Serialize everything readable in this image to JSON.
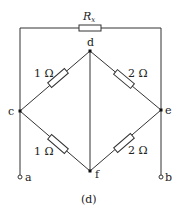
{
  "diagram": {
    "type": "circuit",
    "caption": "(d)",
    "nodes": {
      "c": "c",
      "d": "d",
      "e": "e",
      "f": "f",
      "a": "a",
      "b": "b"
    },
    "resistors": {
      "rx": "R",
      "rx_sub": "x",
      "cd": "1 Ω",
      "de": "2 Ω",
      "cf": "1 Ω",
      "fe": "2 Ω"
    },
    "connections": [
      {
        "from": "c",
        "to": "e",
        "via": "Rx (top wire)"
      },
      {
        "from": "c",
        "to": "d",
        "via": "1 Ω"
      },
      {
        "from": "d",
        "to": "e",
        "via": "2 Ω"
      },
      {
        "from": "c",
        "to": "f",
        "via": "1 Ω"
      },
      {
        "from": "f",
        "to": "e",
        "via": "2 Ω"
      },
      {
        "from": "d",
        "to": "f",
        "via": "wire"
      },
      {
        "from": "c",
        "to": "a",
        "via": "wire"
      },
      {
        "from": "e",
        "to": "b",
        "via": "wire"
      }
    ]
  }
}
